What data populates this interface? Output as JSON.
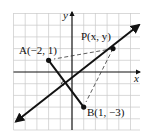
{
  "diagram": {
    "type": "coordinate-geometry",
    "grid": {
      "x_min": -5,
      "x_max": 6,
      "y_min": -5,
      "y_max": 5,
      "origin_px": [
        72,
        72
      ],
      "unit_px": 11.7
    },
    "axes": {
      "x_label": "x",
      "y_label": "y"
    },
    "points": [
      {
        "id": "A",
        "label": "A(−2, 1)",
        "x": -2,
        "y": 1
      },
      {
        "id": "B",
        "label": "B(1, −3)",
        "x": 1,
        "y": -3
      },
      {
        "id": "P",
        "label": "P(x, y)",
        "x": 3.5,
        "y": 2
      }
    ],
    "segments": [
      {
        "from": "A",
        "to": "B",
        "style": "solid"
      },
      {
        "from": "P",
        "to": "A",
        "style": "dashed"
      },
      {
        "from": "P",
        "to": "B",
        "style": "dashed"
      }
    ],
    "line": {
      "name": "perpendicular bisector",
      "slope": 0.75,
      "passes_through": [
        -0.5,
        -1
      ],
      "arrows": "both"
    },
    "right_angle_marker": {
      "at": [
        -0.5,
        -1
      ]
    }
  },
  "labels": {
    "A": "A(−2, 1)",
    "B": "B(1, −3)",
    "P": "P(x, y)",
    "x": "x",
    "y": "y"
  }
}
